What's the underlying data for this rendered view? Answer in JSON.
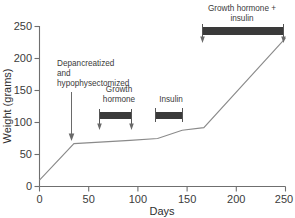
{
  "chart_data": {
    "type": "line",
    "title": "",
    "xlabel": "Days",
    "ylabel": "Weight (grams)",
    "xlim": [
      0,
      250
    ],
    "ylim": [
      0,
      250
    ],
    "grid": false,
    "legend": "none",
    "x_ticks": [
      "0",
      "50",
      "100",
      "150",
      "200",
      "250"
    ],
    "x_tick_values": [
      0,
      50,
      100,
      150,
      200,
      250
    ],
    "y_ticks": [
      "0",
      "50",
      "100",
      "150",
      "200",
      "250"
    ],
    "y_tick_values": [
      0,
      50,
      100,
      150,
      200,
      250
    ],
    "series": [
      {
        "name": "Body weight",
        "x": [
          0,
          35,
          92,
          120,
          145,
          167,
          250
        ],
        "values": [
          10,
          67,
          72,
          75,
          88,
          92,
          232
        ]
      }
    ],
    "annotations": [
      {
        "id": "depancreatized",
        "label": "Depancreatized and hypophysectomized",
        "label_lines": [
          "Depancreatized",
          "and",
          "hypophysectomized"
        ],
        "marker": "arrow",
        "x": 35
      },
      {
        "id": "growth-hormone",
        "label": "Growth hormone",
        "label_lines": [
          "Growth",
          "hormone"
        ],
        "marker": "bar",
        "x_start": 61,
        "x_end": 92
      },
      {
        "id": "insulin",
        "label": "Insulin",
        "label_lines": [
          "Insulin"
        ],
        "marker": "bar",
        "x_start": 118,
        "x_end": 144
      },
      {
        "id": "growth-hormone-plus-insulin",
        "label": "Growth hormone + insulin",
        "label_lines": [
          "Growth hormone +",
          "insulin"
        ],
        "marker": "bar",
        "x_start": 165,
        "x_end": 248
      }
    ]
  },
  "axes": {
    "x_title": "Days",
    "y_title": "Weight (grams)",
    "x_tick_0": "0",
    "x_tick_1": "50",
    "x_tick_2": "100",
    "x_tick_3": "150",
    "x_tick_4": "200",
    "x_tick_5": "250",
    "y_tick_0": "0",
    "y_tick_1": "50",
    "y_tick_2": "100",
    "y_tick_3": "150",
    "y_tick_4": "200",
    "y_tick_5": "250"
  },
  "annotations_text": {
    "depancreatized_line1": "Depancreatized",
    "depancreatized_line2": "and",
    "depancreatized_line3": "hypophysectomized",
    "growth_hormone_line1": "Growth",
    "growth_hormone_line2": "hormone",
    "insulin_line1": "Insulin",
    "gh_insulin_line1": "Growth hormone +",
    "gh_insulin_line2": "insulin"
  },
  "colors": {
    "bar_fill": "#3a3a3a",
    "line_stroke": "#8a8a8a",
    "axis_stroke": "#6f6f6f",
    "text": "#3b3b3b",
    "background": "#ffffff"
  }
}
